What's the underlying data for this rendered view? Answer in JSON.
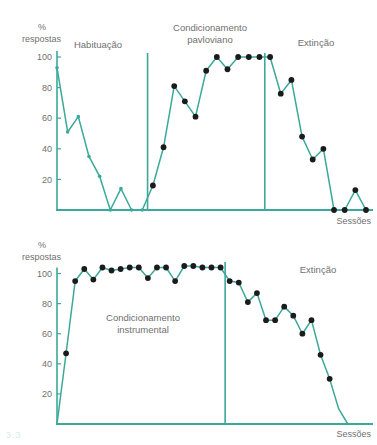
{
  "figure": {
    "accent_color": "#3aa99b",
    "marker_dark_color": "#1b1b1b",
    "text_color": "#6f6f6f",
    "caption_mark": "3.3"
  },
  "chart_data": [
    {
      "id": "top",
      "type": "line",
      "title": "",
      "xlabel": "Sessões",
      "ylabel": "% respostas",
      "ylabel_unit": "%",
      "ylabel_word": "respostas",
      "ylim": [
        0,
        105
      ],
      "yticks": [
        20,
        40,
        60,
        80,
        100
      ],
      "ytick_labels": [
        "20",
        "40",
        "60",
        "80",
        "100"
      ],
      "grid": false,
      "legend": "none",
      "phases": [
        {
          "label": "Habituação",
          "start": 1,
          "end": 9
        },
        {
          "label": "Condicionamento pavloviano",
          "start": 10,
          "end": 20
        },
        {
          "label": "Extinção",
          "start": 21,
          "end": 30
        }
      ],
      "phase_dividers": [
        9.5,
        20.5
      ],
      "x": [
        1,
        2,
        3,
        4,
        5,
        6,
        7,
        8,
        9,
        10,
        11,
        12,
        13,
        14,
        15,
        16,
        17,
        18,
        19,
        20,
        21,
        22,
        23,
        24,
        25,
        26,
        27,
        28,
        29,
        30
      ],
      "values": [
        93,
        51,
        61,
        35,
        22,
        0,
        14,
        0,
        0,
        16,
        41,
        81,
        71,
        61,
        91,
        100,
        92,
        100,
        100,
        100,
        100,
        76,
        85,
        48,
        33,
        40,
        0,
        0,
        13,
        0
      ],
      "marker_styles": [
        "small",
        "small",
        "small",
        "small",
        "small",
        "small",
        "small",
        "small",
        "small",
        "large",
        "large",
        "large",
        "large",
        "large",
        "large",
        "large",
        "large",
        "large",
        "large",
        "large",
        "large",
        "large",
        "large",
        "large",
        "large",
        "large",
        "large",
        "large",
        "large",
        "large"
      ]
    },
    {
      "id": "bottom",
      "type": "line",
      "title": "",
      "xlabel": "Sessões",
      "ylabel": "% respostas",
      "ylabel_unit": "%",
      "ylabel_word": "respostas",
      "ylim": [
        0,
        112
      ],
      "yticks": [
        20,
        40,
        60,
        80,
        100
      ],
      "ytick_labels": [
        "20",
        "40",
        "60",
        "80",
        "100"
      ],
      "grid": false,
      "legend": "none",
      "phases": [
        {
          "label": "Condicionamento instrumental",
          "start": 1,
          "end": 19
        },
        {
          "label": "Extinção",
          "start": 20,
          "end": 35
        }
      ],
      "phase_dividers": [
        19.5
      ],
      "x": [
        1,
        2,
        3,
        4,
        5,
        6,
        7,
        8,
        9,
        10,
        11,
        12,
        13,
        14,
        15,
        16,
        17,
        18,
        19,
        20,
        21,
        22,
        23,
        24,
        25,
        26,
        27,
        28,
        29,
        30,
        31,
        32,
        33,
        34,
        35
      ],
      "values": [
        0,
        47,
        95,
        103,
        96,
        104,
        102,
        103,
        104,
        104,
        97,
        104,
        104,
        95,
        105,
        105,
        104,
        104,
        104,
        95,
        94,
        81,
        87,
        69,
        69,
        78,
        72,
        60,
        69,
        46,
        30,
        10,
        0,
        0,
        0
      ],
      "marker_styles": [
        "none",
        "large",
        "large",
        "large",
        "large",
        "large",
        "large",
        "large",
        "large",
        "large",
        "large",
        "large",
        "large",
        "large",
        "large",
        "large",
        "large",
        "large",
        "large",
        "large",
        "large",
        "large",
        "large",
        "large",
        "large",
        "large",
        "large",
        "large",
        "large",
        "large",
        "large",
        "none",
        "none",
        "none",
        "none"
      ]
    }
  ],
  "top_chart": {
    "y_axis_unit": "%",
    "y_axis_name": "respostas",
    "y_ticks": [
      "100",
      "80",
      "60",
      "40",
      "20"
    ],
    "phase_habituacao": "Habituação",
    "phase_condicionamento_line1": "Condicionamento",
    "phase_condicionamento_line2": "pavloviano",
    "phase_extincao": "Extinção",
    "x_axis_name": "Sessões"
  },
  "bottom_chart": {
    "y_axis_unit": "%",
    "y_axis_name": "respostas",
    "y_ticks": [
      "100",
      "80",
      "60",
      "40",
      "20"
    ],
    "phase_condicionamento_line1": "Condicionamento",
    "phase_condicionamento_line2": "instrumental",
    "phase_extincao": "Extinção",
    "x_axis_name": "Sessões"
  }
}
